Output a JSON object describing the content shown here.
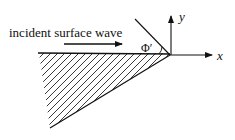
{
  "diagram": {
    "incident_label": "incident surface wave",
    "angle_label": "Φ′",
    "x_axis_label": "x",
    "y_axis_label": "y"
  },
  "colors": {
    "ink": "#111111",
    "background": "#ffffff"
  }
}
